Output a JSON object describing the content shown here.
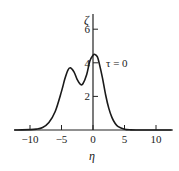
{
  "chart_data": {
    "type": "line",
    "title": "",
    "xlabel": "η",
    "ylabel": "ζ",
    "xlim": [
      -12.5,
      12.5
    ],
    "ylim": [
      0,
      7
    ],
    "xticks": [
      -10,
      -5,
      0,
      5,
      10
    ],
    "xtick_labels": [
      "−10",
      "−5",
      "0",
      "5",
      "10"
    ],
    "yticks": [
      2,
      4,
      6
    ],
    "ytick_labels": [
      "2",
      "4",
      "6"
    ],
    "grid": false,
    "legend": null,
    "annotations": [
      {
        "text": "τ = 0",
        "x": 2.5,
        "y": 4.0
      }
    ],
    "series": [
      {
        "name": "τ = 0",
        "x": [
          -12.5,
          -10,
          -9,
          -8,
          -7,
          -6,
          -5,
          -4.5,
          -4,
          -3.6,
          -3,
          -2.5,
          -2,
          -1.6,
          -1,
          -0.5,
          0,
          0.3,
          0.7,
          1,
          1.5,
          2,
          2.5,
          3,
          3.5,
          4,
          5,
          6,
          7,
          8,
          10,
          12.5
        ],
        "values": [
          0,
          0.02,
          0.05,
          0.15,
          0.45,
          1.1,
          2.3,
          3.0,
          3.55,
          3.7,
          3.45,
          3.0,
          2.72,
          2.75,
          3.3,
          4.1,
          4.45,
          4.5,
          4.35,
          3.95,
          3.1,
          2.1,
          1.3,
          0.75,
          0.4,
          0.2,
          0.05,
          0.01,
          0,
          0,
          0,
          0
        ]
      }
    ]
  }
}
